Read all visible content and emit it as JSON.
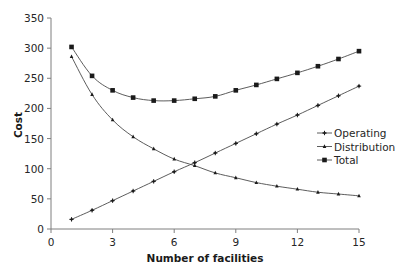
{
  "chart_data": {
    "type": "line",
    "title": "",
    "xlabel": "Number of facilities",
    "ylabel": "Cost",
    "xlim": [
      0,
      15
    ],
    "ylim": [
      0,
      350
    ],
    "x_ticks": [
      0,
      3,
      6,
      9,
      12,
      15
    ],
    "y_ticks": [
      0,
      50,
      100,
      150,
      200,
      250,
      300,
      350
    ],
    "grid": false,
    "legend_position": "right-middle",
    "x": [
      1,
      2,
      3,
      4,
      5,
      6,
      7,
      8,
      9,
      10,
      11,
      12,
      13,
      14,
      15
    ],
    "series": [
      {
        "name": "Operating",
        "marker": "plus",
        "values": [
          16,
          31,
          47,
          63,
          79,
          95,
          110,
          126,
          142,
          158,
          174,
          189,
          205,
          221,
          237
        ]
      },
      {
        "name": "Distribution",
        "marker": "triangle",
        "values": [
          286,
          223,
          181,
          153,
          133,
          116,
          105,
          93,
          85,
          77,
          71,
          66,
          61,
          58,
          55
        ]
      },
      {
        "name": "Total",
        "marker": "square",
        "values": [
          302,
          254,
          230,
          218,
          213,
          213,
          216,
          220,
          230,
          239,
          249,
          259,
          270,
          282,
          295
        ]
      }
    ]
  },
  "colors": {
    "line": "#4a4a4a",
    "marker": "#1a1a1a",
    "axis": "#7f7f7f",
    "text": "#262626"
  }
}
